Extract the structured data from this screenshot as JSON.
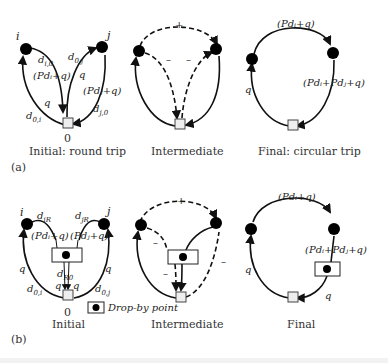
{
  "figure": {
    "panel_a": {
      "tag": "(a)",
      "initial": {
        "caption": "Initial: round trip",
        "depot_label": "0",
        "node_i": "i",
        "node_j": "j",
        "labels": {
          "d_i0": "d",
          "d_i0_sub": "i,0",
          "d_0j": "d",
          "d_0j_sub": "0,j",
          "pdi_q": "(Pdᵢ+q)",
          "q_right": "q",
          "q_left": "q",
          "pdj_q": "(Pdⱼ+q)",
          "d_j0": "d",
          "d_j0_sub": "j,0",
          "d_0i": "d",
          "d_0i_sub": "0,i"
        }
      },
      "intermediate": {
        "caption": "Intermediate",
        "plus": "+",
        "minus_left": "–",
        "minus_right": "–"
      },
      "final": {
        "caption": "Final: circular trip",
        "top_label": "(Pdᵢ+q)",
        "right_label": "(Pdᵢ+Pdⱼ+q)",
        "left_label": "q"
      }
    },
    "panel_b": {
      "tag": "(b)",
      "initial": {
        "caption": "Initial",
        "depot_label": "0",
        "node_i": "i",
        "node_j": "j",
        "labels": {
          "d_iR": "d",
          "d_iR_sub": "iR",
          "d_jR": "d",
          "d_jR_sub": "jR",
          "pdi_q": "(Pdᵢ+q)",
          "pdj_q": "(Pdⱼ+q)",
          "q_left": "q",
          "q_right": "q",
          "d_R0": "d",
          "d_R0_sub": "R0",
          "q_mid_left": "q",
          "q_mid_right": "q",
          "d_0i": "d",
          "d_0i_sub": "0,i",
          "d_0j": "d",
          "d_0j_sub": "0,j"
        }
      },
      "legend": {
        "label": "Drop-by point"
      },
      "intermediate": {
        "caption": "Intermediate",
        "plus": "+",
        "minus_1": "–",
        "minus_2": "–",
        "minus_3": "–"
      },
      "final": {
        "caption": "Final",
        "top_label": "(Pdᵢ+q)",
        "right_label": "(Pdᵢ+Pdⱼ+q)",
        "left_label": "q",
        "bottom_label": "q"
      }
    }
  }
}
